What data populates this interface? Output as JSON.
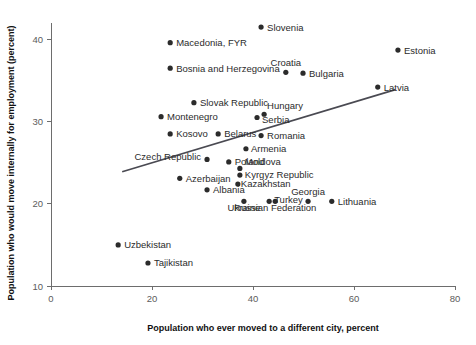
{
  "chart_data": {
    "type": "scatter",
    "title": "",
    "xlabel": "Population who ever moved to a different city, percent",
    "ylabel": "Population who would move internally for employment (percent)",
    "xlim": [
      0,
      80
    ],
    "ylim": [
      10,
      42
    ],
    "xticks": [
      0,
      20,
      40,
      60,
      80
    ],
    "yticks": [
      10,
      20,
      30,
      40
    ],
    "grid": false,
    "legend": "none",
    "marker_color": "#2b2b2b",
    "trendline_color": "#4a4a52",
    "axis_color": "#6d6d6d",
    "points": [
      {
        "name": "Slovenia",
        "x": 41.6,
        "y": 41.5,
        "label_dx": 6,
        "label_dy": 3.4,
        "anchor": "start"
      },
      {
        "name": "Estonia",
        "x": 68.7,
        "y": 38.7,
        "label_dx": 6,
        "label_dy": 3.4,
        "anchor": "start"
      },
      {
        "name": "Macedonia, FYR",
        "x": 23.6,
        "y": 39.6,
        "label_dx": 6,
        "label_dy": 3.4,
        "anchor": "start"
      },
      {
        "name": "Bosnia and Herzegovina",
        "x": 23.6,
        "y": 36.5,
        "label_dx": 6,
        "label_dy": 3.4,
        "anchor": "start"
      },
      {
        "name": "Croatia",
        "x": 46.5,
        "y": 36.0,
        "label_dx": 0,
        "label_dy": -6,
        "anchor": "middle"
      },
      {
        "name": "Bulgaria",
        "x": 49.9,
        "y": 35.9,
        "label_dx": 6,
        "label_dy": 3.4,
        "anchor": "start"
      },
      {
        "name": "Latvia",
        "x": 64.7,
        "y": 34.2,
        "label_dx": 6,
        "label_dy": 3.4,
        "anchor": "start"
      },
      {
        "name": "Slovak Republic",
        "x": 28.3,
        "y": 32.3,
        "label_dx": 6,
        "label_dy": 3.4,
        "anchor": "start"
      },
      {
        "name": "Montenegro",
        "x": 21.8,
        "y": 30.6,
        "label_dx": 6,
        "label_dy": 3.4,
        "anchor": "start"
      },
      {
        "name": "Hungary",
        "x": 42.2,
        "y": 30.9,
        "label_dx": 3,
        "label_dy": -5,
        "anchor": "start"
      },
      {
        "name": "Serbia",
        "x": 40.8,
        "y": 30.5,
        "label_dx": 5,
        "label_dy": 5.5,
        "anchor": "start"
      },
      {
        "name": "Kosovo",
        "x": 23.6,
        "y": 28.5,
        "label_dx": 6,
        "label_dy": 3.4,
        "anchor": "start"
      },
      {
        "name": "Belarus",
        "x": 33.1,
        "y": 28.5,
        "label_dx": 6,
        "label_dy": 3.4,
        "anchor": "start"
      },
      {
        "name": "Romania",
        "x": 41.6,
        "y": 28.3,
        "label_dx": 6,
        "label_dy": 3.4,
        "anchor": "start"
      },
      {
        "name": "Czech Republic",
        "x": 30.9,
        "y": 25.4,
        "label_dx": -6,
        "label_dy": 0.5,
        "anchor": "end"
      },
      {
        "name": "Armenia",
        "x": 38.6,
        "y": 26.7,
        "label_dx": 5,
        "label_dy": 3.4,
        "anchor": "start"
      },
      {
        "name": "Poland",
        "x": 35.2,
        "y": 25.1,
        "label_dx": 6,
        "label_dy": 3.4,
        "anchor": "start"
      },
      {
        "name": "Moldova",
        "x": 37.4,
        "y": 24.3,
        "label_dx": 5,
        "label_dy": -3,
        "anchor": "start"
      },
      {
        "name": "Kyrgyz Republic",
        "x": 37.4,
        "y": 23.5,
        "label_dx": 5,
        "label_dy": 3.4,
        "anchor": "start"
      },
      {
        "name": "Azerbaijan",
        "x": 25.5,
        "y": 23.1,
        "label_dx": 6,
        "label_dy": 3.4,
        "anchor": "start"
      },
      {
        "name": "Kazakhstan",
        "x": 37.0,
        "y": 22.4,
        "label_dx": 3,
        "label_dy": 3.4,
        "anchor": "start"
      },
      {
        "name": "Albania",
        "x": 30.9,
        "y": 21.7,
        "label_dx": 6,
        "label_dy": 3.4,
        "anchor": "start"
      },
      {
        "name": "Ukraine",
        "x": 38.2,
        "y": 20.3,
        "label_dx": 0,
        "label_dy": 10,
        "anchor": "middle"
      },
      {
        "name": "Turkey",
        "x": 43.2,
        "y": 20.3,
        "label_dx": 5,
        "label_dy": 2.0,
        "anchor": "start"
      },
      {
        "name": "Russian Federation",
        "x": 44.4,
        "y": 20.3,
        "label_dx": 0,
        "label_dy": 10,
        "anchor": "middle"
      },
      {
        "name": "Georgia",
        "x": 50.9,
        "y": 20.3,
        "label_dx": 0,
        "label_dy": -6,
        "anchor": "middle"
      },
      {
        "name": "Lithuania",
        "x": 55.6,
        "y": 20.3,
        "label_dx": 6,
        "label_dy": 3.4,
        "anchor": "start"
      },
      {
        "name": "Uzbekistan",
        "x": 13.3,
        "y": 15.0,
        "label_dx": 6,
        "label_dy": 3.4,
        "anchor": "start"
      },
      {
        "name": "Tajikistan",
        "x": 19.2,
        "y": 12.8,
        "label_dx": 6,
        "label_dy": 3.4,
        "anchor": "start"
      }
    ],
    "trendline": {
      "x0": 14.1,
      "y0": 23.9,
      "x1": 68.2,
      "y1": 33.9
    }
  }
}
